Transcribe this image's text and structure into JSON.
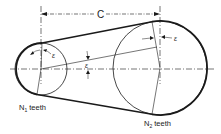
{
  "diagram": {
    "center_distance_label": "C",
    "small_pulley_label": "N",
    "small_pulley_subscript": "1",
    "small_pulley_suffix": " teeth",
    "large_pulley_label": "N",
    "large_pulley_subscript": "2",
    "large_pulley_suffix": " teeth",
    "angle_symbol_small": "ε",
    "angle_symbol_large": "ε",
    "angle_symbol_middle": "ε",
    "colors": {
      "stroke": "#1a1a1a",
      "background": "#ffffff"
    },
    "geometry": {
      "small_circle": {
        "cx": 41,
        "cy": 69,
        "r": 26
      },
      "large_circle": {
        "cx": 160,
        "cy": 68,
        "r": 47
      }
    }
  }
}
